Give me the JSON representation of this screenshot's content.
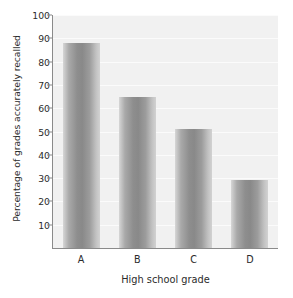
{
  "chart_data": {
    "type": "bar",
    "title": "",
    "categories": [
      "A",
      "B",
      "C",
      "D"
    ],
    "values": [
      88,
      65,
      51,
      29
    ],
    "xlabel": "High school grade",
    "ylabel": "Percentage of grades accurately recalled",
    "ylim": [
      0,
      100
    ],
    "yticks": [
      10,
      20,
      30,
      40,
      50,
      60,
      70,
      80,
      90,
      100
    ],
    "ytick_labels": [
      "10",
      "20",
      "30",
      "40",
      "50",
      "60",
      "70",
      "80",
      "90",
      "100"
    ],
    "grid": true,
    "grid_axis": "y",
    "legend": null,
    "bar_color": "#8e8e8e",
    "plot_background": "#f1f1f1",
    "axis_color": "#8a8a8a",
    "text_color": "#2b2b2b"
  }
}
